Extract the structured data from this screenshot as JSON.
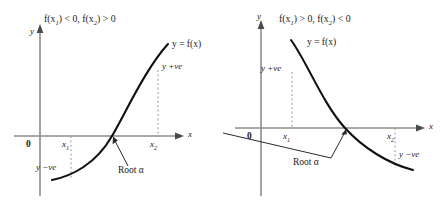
{
  "figure": {
    "background_color": "#ffffff",
    "curve_color": "#111111",
    "axis_color": "#8c8c8c",
    "dotted_color": "#9a9a9a"
  },
  "panels": [
    {
      "id": "left",
      "title": "f(x₁) < 0, f(x₂) > 0",
      "title_parts": {
        "first": "f(x",
        "sub1": "1",
        "mid": ") < 0, f(x",
        "sub2": "2",
        "last": ") > 0"
      },
      "curve_label": "y = f(x)",
      "y_axis_label": "y",
      "x_axis_label": "x",
      "origin_label": "0",
      "tick_labels": [
        "x₁",
        "x₂"
      ],
      "tick1": "x",
      "tick1_sub": "1",
      "tick2": "x",
      "tick2_sub": "2",
      "positive_label": "y +ve",
      "negative_label": "y −ve",
      "root_label": "Root α",
      "shape": "increasing"
    },
    {
      "id": "right",
      "title": "f(x₁) > 0, f(x₂) < 0",
      "title_parts": {
        "first": "f(x",
        "sub1": "1",
        "mid": ") > 0, f(x",
        "sub2": "2",
        "last": ") < 0"
      },
      "curve_label": "y = f(x)",
      "y_axis_label": "y",
      "x_axis_label": "x",
      "origin_label": "0",
      "tick_labels": [
        "x₁",
        "x₂"
      ],
      "tick1": "x",
      "tick1_sub": "1",
      "tick2": "x",
      "tick2_sub": "2",
      "positive_label": "y +ve",
      "negative_label": "y −ve",
      "root_label": "Root α",
      "shape": "decreasing"
    }
  ]
}
